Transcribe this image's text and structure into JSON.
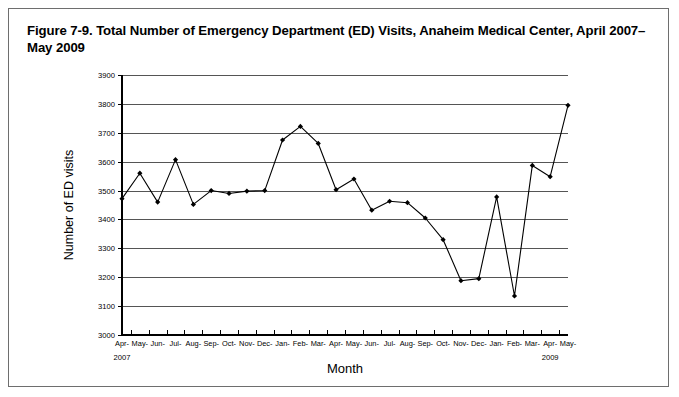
{
  "figure": {
    "title": "Figure 7-9. Total Number of Emergency Department (ED) Visits, Anaheim Medical Center, April 2007–May 2009"
  },
  "chart_data": {
    "type": "line",
    "title": "Figure 7-9. Total Number of Emergency Department (ED) Visits, Anaheim Medical Center, April 2007–May 2009",
    "xlabel": "Month",
    "ylabel": "Number of ED visits",
    "ylim": [
      3000,
      3900
    ],
    "ytick_step": 100,
    "yticks": [
      3000,
      3100,
      3200,
      3300,
      3400,
      3500,
      3600,
      3700,
      3800,
      3900
    ],
    "ytick_labels": [
      "3000",
      "3100",
      "3200",
      "3300",
      "3400",
      "3500",
      "3600",
      "3700",
      "3800",
      "3900"
    ],
    "grid": true,
    "legend": null,
    "legend_position": "none",
    "categories": [
      "Apr-",
      "May-",
      "Jun-",
      "Jul-",
      "Aug-",
      "Sep-",
      "Oct-",
      "Nov-",
      "Dec-",
      "Jan-",
      "Feb-",
      "Mar-",
      "Apr-",
      "May-",
      "Jun-",
      "Jul-",
      "Aug-",
      "Sep-",
      "Oct-",
      "Nov-",
      "Dec-",
      "Jan-",
      "Feb-",
      "Mar-",
      "Apr-",
      "May-"
    ],
    "values": [
      3472,
      3560,
      3460,
      3607,
      3452,
      3500,
      3490,
      3498,
      3500,
      3675,
      3722,
      3663,
      3503,
      3540,
      3432,
      3463,
      3458,
      3405,
      3330,
      3188,
      3195,
      3478,
      3135,
      3587,
      3548,
      3795
    ],
    "annotations": [
      {
        "text": "2007",
        "x_index": 0
      },
      {
        "text": "2009",
        "x_index": 24
      }
    ],
    "series": [
      {
        "name": "Total ED visits",
        "color": "#000000",
        "marker": "filled-diamond",
        "values": [
          3472,
          3560,
          3460,
          3607,
          3452,
          3500,
          3490,
          3498,
          3500,
          3675,
          3722,
          3663,
          3503,
          3540,
          3432,
          3463,
          3458,
          3405,
          3330,
          3188,
          3195,
          3478,
          3135,
          3587,
          3548,
          3795
        ]
      }
    ]
  },
  "colors": {
    "frame": "#6e6e6e",
    "grid": "#555555",
    "axis": "#000000",
    "line": "#000000",
    "background": "#ffffff"
  }
}
